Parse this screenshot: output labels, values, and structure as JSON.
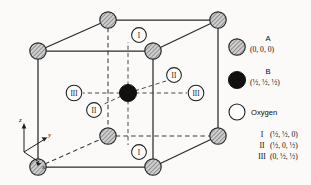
{
  "figure": {
    "caption_title": "Perovskite ABO3 unit cell",
    "background_color": "#fbfaf8",
    "line_color": "#2a2a2a",
    "atom_A_fill": "#b9b9b9",
    "atom_B_fill": "#111111",
    "oxygen_fill": "#ffffff"
  },
  "axes": {
    "z_label": "z",
    "y_label": "y",
    "x_label": "x"
  },
  "legend": {
    "entries": [
      {
        "symbol": "A",
        "marker": "hatched-circle",
        "coords": "(0, 0, 0)"
      },
      {
        "symbol": "B",
        "marker": "filled-circle",
        "coords": "(½, ½, ½)"
      },
      {
        "symbol": "Oxygen",
        "marker": "open-circle",
        "coords": ""
      }
    ],
    "oxygen_sites": [
      {
        "roman": "I",
        "coords": "(½, ½, 0)"
      },
      {
        "roman": "II",
        "coords": "(½, 0, ½)"
      },
      {
        "roman": "III",
        "coords": "(0, ½, ½)"
      }
    ]
  },
  "oxygen_markers": [
    {
      "roman": "I",
      "cx": 139,
      "cy": 35
    },
    {
      "roman": "I",
      "cx": 139,
      "cy": 152
    },
    {
      "roman": "II",
      "cx": 174,
      "cy": 75
    },
    {
      "roman": "II",
      "cx": 94,
      "cy": 110
    },
    {
      "roman": "III",
      "cx": 74,
      "cy": 93
    },
    {
      "roman": "III",
      "cx": 196,
      "cy": 93
    }
  ],
  "atoms_A": [
    {
      "name": "corner-front-top-left",
      "cx": 38,
      "cy": 51
    },
    {
      "name": "corner-front-top-right",
      "cx": 153,
      "cy": 51
    },
    {
      "name": "corner-front-bottom-left",
      "cx": 38,
      "cy": 167
    },
    {
      "name": "corner-front-bottom-right",
      "cx": 153,
      "cy": 167
    },
    {
      "name": "corner-back-top-left",
      "cx": 108,
      "cy": 20
    },
    {
      "name": "corner-back-top-right",
      "cx": 218,
      "cy": 20
    },
    {
      "name": "corner-back-bottom-left",
      "cx": 108,
      "cy": 136
    },
    {
      "name": "corner-back-bottom-right",
      "cx": 218,
      "cy": 136
    }
  ],
  "atom_B": {
    "name": "body-center-B",
    "cx": 128,
    "cy": 93
  }
}
